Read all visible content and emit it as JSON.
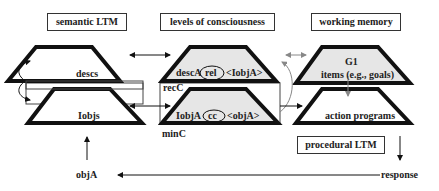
{
  "headers": {
    "semantic": "semantic LTM",
    "consciousness": "levels of consciousness",
    "working": "working memory"
  },
  "semantic": {
    "top": "descs",
    "bottom": "Iobjs"
  },
  "consciousness": {
    "top_left": "descA",
    "top_oval": "rel",
    "top_right": "<IobjA>",
    "bottom_left": "IobjA",
    "bottom_oval": "cc",
    "bottom_right": "<objA>",
    "rec_label": "recC",
    "min_label": "minC"
  },
  "working": {
    "top_line1": "G1",
    "top_line2": "items (e.g., goals)",
    "bottom": "action programs"
  },
  "procedural": "procedural LTM",
  "response": "response",
  "input": "objA",
  "colors": {
    "fill_gray": "#e6e6e6",
    "stroke": "#111111",
    "arrow_gray": "#888888"
  }
}
